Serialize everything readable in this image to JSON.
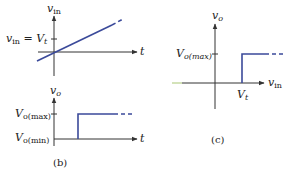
{
  "colors": {
    "axis": "#333333",
    "signal": "#3b4a9a",
    "axis_tail": "#b8d08a",
    "text": "#222222"
  },
  "panel_a": {
    "y_axis_label": "v",
    "y_axis_sub": "in",
    "x_axis_label": "t",
    "tick_label_lhs": "v",
    "tick_label_lhs_sub": "in",
    "tick_label_eq": " = ",
    "tick_label_rhs": "V",
    "tick_label_rhs_sub": "t"
  },
  "panel_b": {
    "y_axis_label": "v",
    "y_axis_sub": "o",
    "x_axis_label": "t",
    "tick_high_label": "V",
    "tick_high_sub": "o(max)",
    "tick_low_label": "V",
    "tick_low_sub": "o(min)",
    "caption": "(b)"
  },
  "panel_c": {
    "y_axis_label": "v",
    "y_axis_sub": "o",
    "x_axis_label": "v",
    "x_axis_sub": "in",
    "tick_high_label": "V",
    "tick_high_sub": "o(max)",
    "threshold_label": "V",
    "threshold_sub": "t",
    "caption": "(c)"
  }
}
